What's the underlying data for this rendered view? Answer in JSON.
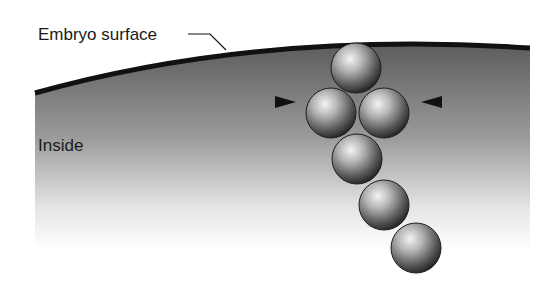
{
  "diagram": {
    "labels": {
      "surface": "Embryo surface",
      "inside": "Inside"
    },
    "colors": {
      "surface_line": "#111111",
      "tissue_top": "#5a5a5a",
      "tissue_bottom": "#ffffff",
      "cell_dark": "#2a2a2a",
      "cell_light": "#f2f2f2",
      "arrowhead": "#111111"
    },
    "cells": [
      {
        "id": "cell-1",
        "cx": 356,
        "cy": 68,
        "r": 26
      },
      {
        "id": "cell-2",
        "cx": 331,
        "cy": 113,
        "r": 26
      },
      {
        "id": "cell-3",
        "cx": 384,
        "cy": 113,
        "r": 26
      },
      {
        "id": "cell-4",
        "cx": 357,
        "cy": 159,
        "r": 26
      },
      {
        "id": "cell-5",
        "cx": 384,
        "cy": 205,
        "r": 26
      },
      {
        "id": "cell-6",
        "cx": 416,
        "cy": 248,
        "r": 26
      }
    ],
    "arrowheads": [
      {
        "id": "left-arrowhead",
        "direction": "right",
        "x": 275,
        "y": 102
      },
      {
        "id": "right-arrowhead",
        "direction": "left",
        "x": 442,
        "y": 102
      }
    ]
  }
}
